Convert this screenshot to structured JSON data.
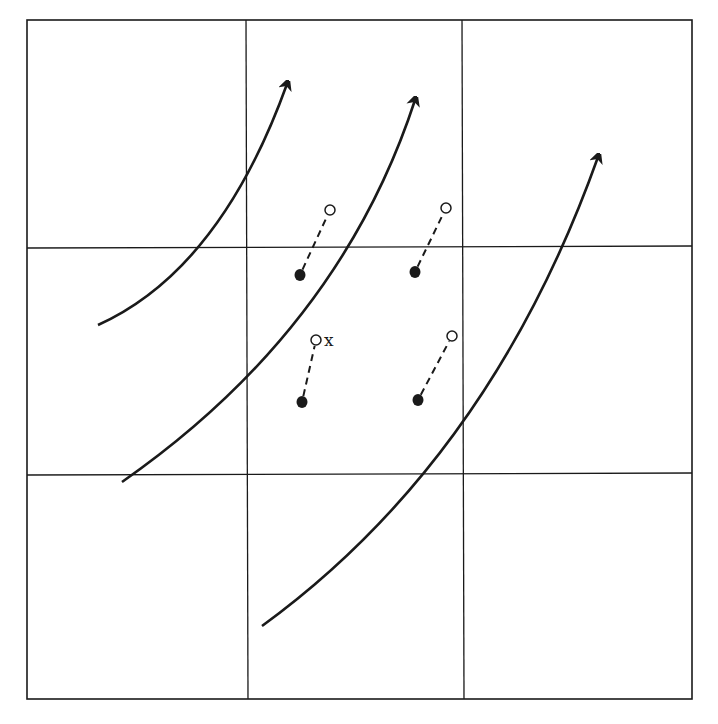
{
  "diagram": {
    "type": "grid-flow-diagram",
    "grid": {
      "rows": 3,
      "cols": 3,
      "outer": {
        "left": 27,
        "top": 20,
        "right": 692,
        "bottom": 699
      },
      "vertical_lines_x": [
        246,
        462
      ],
      "horizontal_lines_y": [
        248,
        475
      ],
      "line_color": "#1a1a1a"
    },
    "flow_arrows": [
      {
        "id": "arrow-1",
        "start": [
          98,
          325
        ],
        "ctrl": [
          220,
          270
        ],
        "end": [
          287,
          84
        ]
      },
      {
        "id": "arrow-2",
        "start": [
          122,
          482
        ],
        "ctrl": [
          340,
          330
        ],
        "end": [
          415,
          100
        ]
      },
      {
        "id": "arrow-3",
        "start": [
          262,
          626
        ],
        "ctrl": [
          490,
          460
        ],
        "end": [
          598,
          157
        ]
      }
    ],
    "particles": [
      {
        "id": "p1",
        "solid": [
          300,
          275
        ],
        "open": [
          330,
          210
        ],
        "label": ""
      },
      {
        "id": "p2",
        "solid": [
          415,
          272
        ],
        "open": [
          446,
          208
        ],
        "label": ""
      },
      {
        "id": "p3",
        "solid": [
          302,
          402
        ],
        "open": [
          316,
          340
        ],
        "label": "x"
      },
      {
        "id": "p4",
        "solid": [
          418,
          400
        ],
        "open": [
          452,
          336
        ],
        "label": ""
      }
    ],
    "colors": {
      "ink": "#1a1a1a",
      "background": "#ffffff"
    }
  }
}
